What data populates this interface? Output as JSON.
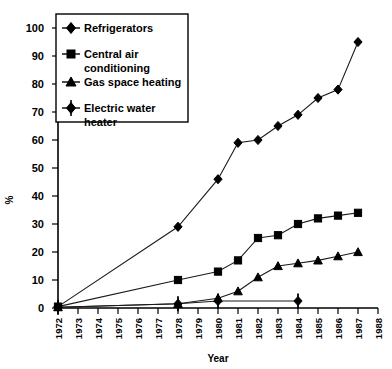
{
  "chart_data": {
    "type": "line",
    "title": "",
    "xlabel": "Year",
    "ylabel": "%",
    "xlim": [
      1972,
      1988
    ],
    "ylim": [
      0,
      100
    ],
    "grid": false,
    "legend_position": "top-left",
    "categories": [
      1972,
      1973,
      1974,
      1975,
      1976,
      1977,
      1978,
      1979,
      1980,
      1981,
      1982,
      1983,
      1984,
      1985,
      1986,
      1987,
      1988
    ],
    "xticklabels": [
      "1972",
      "1973",
      "1974",
      "1975",
      "1976",
      "1977",
      "1978",
      "1979",
      "1980",
      "1981",
      "1982",
      "1983",
      "1984",
      "1985",
      "1986",
      "1987",
      "1988"
    ],
    "yticklabels": [
      "0",
      "10",
      "20",
      "30",
      "40",
      "50",
      "60",
      "70",
      "80",
      "90",
      "100"
    ],
    "yticks": [
      0,
      10,
      20,
      30,
      40,
      50,
      60,
      70,
      80,
      90,
      100
    ],
    "series": [
      {
        "name": "Refrigerators",
        "marker": "diamond",
        "x": [
          1972,
          1978,
          1980,
          1981,
          1982,
          1983,
          1984,
          1985,
          1986,
          1987
        ],
        "values": [
          0.5,
          29,
          46,
          59,
          60,
          65,
          69,
          75,
          78,
          95
        ]
      },
      {
        "name": "Central air conditioning",
        "marker": "square",
        "x": [
          1972,
          1978,
          1980,
          1981,
          1982,
          1983,
          1984,
          1985,
          1986,
          1987
        ],
        "values": [
          0.5,
          10,
          13,
          17,
          25,
          26,
          30,
          32,
          33,
          34
        ]
      },
      {
        "name": "Gas space heating",
        "marker": "triangle",
        "x": [
          1972,
          1978,
          1980,
          1981,
          1982,
          1983,
          1984,
          1985,
          1986,
          1987
        ],
        "values": [
          0.3,
          1.5,
          3.5,
          6,
          11,
          15,
          16,
          17,
          18.5,
          20
        ]
      },
      {
        "name": "Electric water heater",
        "marker": "cross-diamond",
        "x": [
          1972,
          1978,
          1980,
          1984
        ],
        "values": [
          0.3,
          1.5,
          2.5,
          2.5
        ]
      }
    ]
  },
  "legend": {
    "entries": [
      {
        "label": "Refrigerators"
      },
      {
        "label": "Central air"
      },
      {
        "label": "conditioning"
      },
      {
        "label": "Gas space heating"
      },
      {
        "label": "Electric water"
      },
      {
        "label": "heater"
      }
    ]
  }
}
